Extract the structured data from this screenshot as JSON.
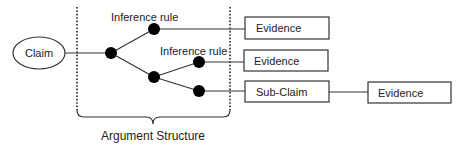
{
  "diagram": {
    "title": "Argument Structure",
    "claim": {
      "label": "Claim"
    },
    "inference_rules": [
      {
        "label": "Inference rule"
      },
      {
        "label": "Inference rule"
      }
    ],
    "boxes": [
      {
        "id": "evidence-1",
        "label": "Evidence"
      },
      {
        "id": "evidence-2",
        "label": "Evidence"
      },
      {
        "id": "sub-claim",
        "label": "Sub-Claim"
      },
      {
        "id": "evidence-3",
        "label": "Evidence"
      }
    ],
    "bracket_label": "Argument Structure",
    "colors": {
      "stroke": "#333333",
      "node": "#000000",
      "background": "#ffffff"
    }
  }
}
